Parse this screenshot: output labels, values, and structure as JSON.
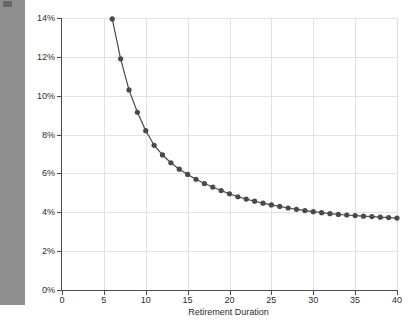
{
  "figure": {
    "background_color": "#ffffff",
    "left_strip_color": "#8f8f8f"
  },
  "chart_data": {
    "type": "line",
    "title": "",
    "subtitle": "",
    "xlabel": "Retirement Duration",
    "ylabel": "Historical SAFEMAX",
    "xlim": [
      0,
      40
    ],
    "ylim": [
      0,
      14
    ],
    "grid": true,
    "legend": null,
    "legend_position": "none",
    "y_tick_labels": [
      "0%",
      "2%",
      "4%",
      "6%",
      "8%",
      "10%",
      "12%",
      "14%"
    ],
    "y_ticks": [
      0,
      2,
      4,
      6,
      8,
      10,
      12,
      14
    ],
    "x_tick_labels": [
      "0",
      "5",
      "10",
      "15",
      "20",
      "25",
      "30",
      "35",
      "40"
    ],
    "x_ticks": [
      0,
      5,
      10,
      15,
      20,
      25,
      30,
      35,
      40
    ],
    "y_unit": "%",
    "series": [
      {
        "name": "Historical SAFEMAX",
        "color": "#4a4a4a",
        "marker": "circle",
        "marker_size": 2.6,
        "line_width": 1.2,
        "x": [
          6,
          7,
          8,
          9,
          10,
          11,
          12,
          13,
          14,
          15,
          16,
          17,
          18,
          19,
          20,
          21,
          22,
          23,
          24,
          25,
          26,
          27,
          28,
          29,
          30,
          31,
          32,
          33,
          34,
          35,
          36,
          37,
          38,
          39,
          40
        ],
        "values": [
          13.95,
          11.9,
          10.3,
          9.15,
          8.2,
          7.45,
          6.95,
          6.55,
          6.22,
          5.95,
          5.7,
          5.48,
          5.3,
          5.12,
          4.95,
          4.8,
          4.68,
          4.57,
          4.47,
          4.38,
          4.3,
          4.22,
          4.15,
          4.09,
          4.03,
          3.98,
          3.93,
          3.89,
          3.86,
          3.83,
          3.8,
          3.78,
          3.75,
          3.73,
          3.7
        ]
      }
    ]
  }
}
